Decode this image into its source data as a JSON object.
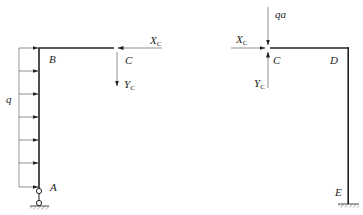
{
  "diagram": {
    "type": "free-body diagram of split frame",
    "left_part": {
      "labels": {
        "B": "B",
        "C": "C",
        "A": "A",
        "q": "q",
        "Xc": "X",
        "Xc_sub": "C",
        "Yc": "Y",
        "Yc_sub": "C"
      },
      "distributed_load": "q (uniform, horizontal, acting rightward on column AB)",
      "support_A": "pin/hinge on link to fixed support"
    },
    "right_part": {
      "labels": {
        "qa": "qa",
        "C": "C",
        "D": "D",
        "E": "E",
        "Xc": "X",
        "Xc_sub": "C",
        "Yc": "Y",
        "Yc_sub": "C"
      },
      "point_load": "qa downward at C",
      "support_E": "fixed support"
    },
    "colors": {
      "member": "#222222",
      "thin": "#444444",
      "hatch": "#555555"
    }
  }
}
